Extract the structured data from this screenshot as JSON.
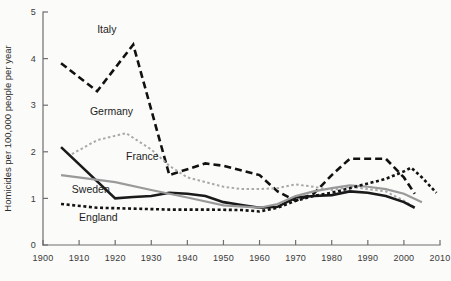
{
  "chart_data": {
    "type": "line",
    "title": "",
    "subtitle": "",
    "xlabel": "",
    "ylabel": "Homicides per 100,000 people per year",
    "xlim": [
      1900,
      2010
    ],
    "ylim": [
      0,
      5
    ],
    "xticks": [
      1900,
      1910,
      1920,
      1930,
      1940,
      1950,
      1960,
      1970,
      1980,
      1990,
      2000,
      2010
    ],
    "yticks": [
      0,
      1,
      2,
      3,
      4,
      5
    ],
    "xtick_labels": [
      "1900",
      "1910",
      "1920",
      "1930",
      "1940",
      "1950",
      "1960",
      "1970",
      "1980",
      "1990",
      "2000",
      "2010"
    ],
    "ytick_labels": [
      "0",
      "1",
      "2",
      "3",
      "4",
      "5"
    ],
    "grid": false,
    "legend": "inline-labels",
    "series": [
      {
        "name": "Italy",
        "label": "Italy",
        "style": "dashed-long",
        "color": "#111111",
        "width": 2.6,
        "dasharray": "7 4",
        "label_x": 1915,
        "label_y": 4.55,
        "x": [
          1905,
          1915,
          1925,
          1935,
          1945,
          1950,
          1960,
          1965,
          1970,
          1975,
          1980,
          1985,
          1990,
          1995,
          2000,
          2003
        ],
        "y": [
          3.9,
          3.3,
          4.3,
          1.5,
          1.75,
          1.7,
          1.5,
          1.15,
          0.95,
          1.1,
          1.5,
          1.85,
          1.85,
          1.85,
          1.45,
          1.1
        ]
      },
      {
        "name": "Germany",
        "label": "Germany",
        "style": "dotted-light",
        "color": "#a9a9a9",
        "width": 2.0,
        "dasharray": "2.5 2.5",
        "label_x": 1913,
        "label_y": 2.78,
        "x": [
          1908,
          1915,
          1923,
          1930,
          1935,
          1940,
          1950,
          1955,
          1960,
          1965,
          1970,
          1975,
          1980,
          1985,
          1990,
          1995,
          2000,
          2003
        ],
        "y": [
          1.95,
          2.25,
          2.4,
          2.05,
          1.7,
          1.45,
          1.25,
          1.2,
          1.2,
          1.22,
          1.3,
          1.25,
          1.18,
          1.25,
          1.2,
          1.15,
          0.95,
          0.8
        ]
      },
      {
        "name": "France",
        "label": "France",
        "style": "solid-dark",
        "color": "#1a1a1a",
        "width": 2.6,
        "label_x": 1923,
        "label_y": 1.83,
        "x": [
          1905,
          1920,
          1925,
          1930,
          1935,
          1940,
          1945,
          1950,
          1955,
          1960,
          1965,
          1970,
          1975,
          1980,
          1985,
          1990,
          1995,
          2000,
          2003
        ],
        "y": [
          2.1,
          1.0,
          1.03,
          1.05,
          1.12,
          1.1,
          1.05,
          0.92,
          0.86,
          0.8,
          0.82,
          1.02,
          1.05,
          1.07,
          1.15,
          1.12,
          1.05,
          0.92,
          0.8
        ]
      },
      {
        "name": "Sweden",
        "label": "Sweden",
        "style": "solid-gray",
        "color": "#9a9a9a",
        "width": 2.2,
        "label_x": 1908,
        "label_y": 1.12,
        "x": [
          1905,
          1920,
          1930,
          1940,
          1950,
          1960,
          1965,
          1970,
          1975,
          1980,
          1985,
          1990,
          1995,
          2000,
          2005
        ],
        "y": [
          1.5,
          1.35,
          1.18,
          1.02,
          0.85,
          0.8,
          0.88,
          1.05,
          1.15,
          1.22,
          1.28,
          1.25,
          1.2,
          1.1,
          0.92
        ]
      },
      {
        "name": "England",
        "label": "England",
        "style": "dotted-dark",
        "color": "#131313",
        "width": 2.6,
        "dasharray": "3 2.6",
        "label_x": 1910,
        "label_y": 0.52,
        "x": [
          1905,
          1915,
          1925,
          1935,
          1945,
          1955,
          1960,
          1965,
          1970,
          1975,
          1980,
          1985,
          1990,
          1995,
          2000,
          2002,
          2005,
          2009
        ],
        "y": [
          0.88,
          0.8,
          0.78,
          0.76,
          0.76,
          0.75,
          0.72,
          0.8,
          0.95,
          1.05,
          1.12,
          1.22,
          1.32,
          1.42,
          1.58,
          1.66,
          1.45,
          1.12
        ]
      }
    ]
  },
  "axis": {
    "y_axis_title": "Homicides per 100,000 people per year"
  }
}
